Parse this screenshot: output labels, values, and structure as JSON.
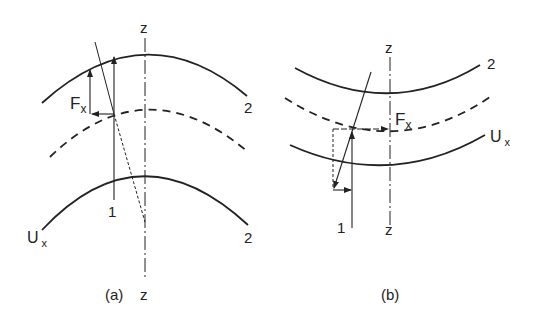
{
  "figure": {
    "panels": [
      {
        "id": "a",
        "caption": "(a)",
        "axis_label_top": "z",
        "axis_label_bottom": "z",
        "curve_top_label": "2",
        "curve_bottom_label": "2",
        "curve_bottom_left_label": "U",
        "curve_bottom_left_sub": "x",
        "line_label": "1",
        "force_label": "F",
        "force_sub": "x"
      },
      {
        "id": "b",
        "caption": "(b)",
        "axis_label_top": "z",
        "axis_label_bottom": "z",
        "curve_top_label": "2",
        "curve_mid_right_label": "U",
        "curve_mid_right_sub": "x",
        "line_label": "1",
        "force_label": "F",
        "force_sub": "x"
      }
    ],
    "colors": {
      "stroke": "#222222",
      "background": "#ffffff"
    }
  }
}
